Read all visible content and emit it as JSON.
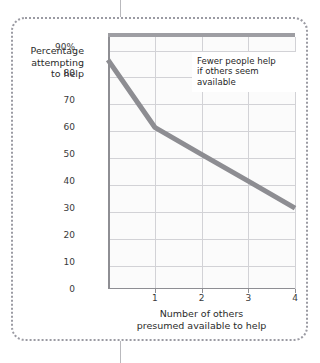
{
  "page": {
    "top_cut_text": "",
    "divider": "page-divider-rule"
  },
  "figure": {
    "callout": {
      "line1": "Fewer people help",
      "line2": "if others seem",
      "line3": "available"
    },
    "y_axis_title": {
      "line1": "Percentage",
      "line2": "attempting",
      "line3": "to help"
    },
    "x_axis_title": {
      "line1": "Number of others",
      "line2": "presumed available to help"
    }
  },
  "chart_data": {
    "type": "line",
    "title": "",
    "xlabel": "Number of others presumed available to help",
    "ylabel": "Percentage attempting to help",
    "x": [
      0,
      1,
      2,
      3,
      4
    ],
    "values": [
      85,
      60,
      50,
      40,
      30
    ],
    "series": [
      {
        "name": "Percentage attempting to help",
        "values": [
          85,
          60,
          50,
          40,
          30
        ],
        "color": "#8d8d92"
      }
    ],
    "xlim": [
      0,
      4
    ],
    "ylim": [
      0,
      95
    ],
    "x_ticks": [
      "1",
      "2",
      "3",
      "4"
    ],
    "x_tick_values": [
      1,
      2,
      3,
      4
    ],
    "y_ticks": [
      "90%",
      "80",
      "70",
      "60",
      "50",
      "40",
      "30",
      "20",
      "10",
      "0"
    ],
    "y_tick_values": [
      90,
      80,
      70,
      60,
      50,
      40,
      30,
      20,
      10,
      0
    ],
    "grid": true,
    "legend": "none",
    "annotations": [
      "Fewer people help if others seem available"
    ],
    "colors": {
      "line": "#8d8d92",
      "grid": "#d2d2d6",
      "axis": "#8e8e93",
      "plot_background": "#fbfbfb",
      "frame_border": "#9b9ba3",
      "text": "#2b2b2b"
    }
  }
}
